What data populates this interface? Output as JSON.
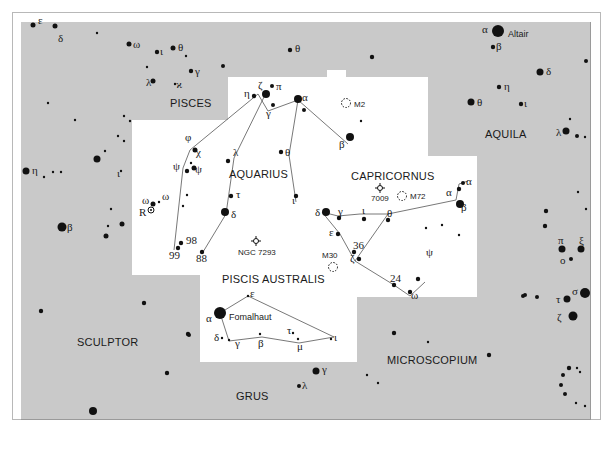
{
  "map": {
    "colors": {
      "background": "#c9c9c9",
      "highlight_region": "#ffffff",
      "stars": "#111111",
      "lines": "#555555"
    },
    "constellations": [
      {
        "name": "PISCES",
        "x": 170,
        "y": 107
      },
      {
        "name": "AQUARIUS",
        "x": 229,
        "y": 178
      },
      {
        "name": "CAPRICORNUS",
        "x": 351,
        "y": 180
      },
      {
        "name": "AQUILA",
        "x": 485,
        "y": 138
      },
      {
        "name": "PISCIS AUSTRALIS",
        "x": 222,
        "y": 283
      },
      {
        "name": "SCULPTOR",
        "x": 77,
        "y": 346
      },
      {
        "name": "MICROSCOPIUM",
        "x": 387,
        "y": 364
      },
      {
        "name": "GRUS",
        "x": 236,
        "y": 400
      }
    ],
    "named_stars": [
      {
        "name": "Altair",
        "x": 508,
        "y": 37
      },
      {
        "name": "Fomalhaut",
        "x": 229,
        "y": 320
      }
    ],
    "deep_sky": [
      {
        "label": "M2",
        "type": "globular-cluster",
        "x": 346,
        "y": 103
      },
      {
        "label": "M72",
        "type": "globular-cluster",
        "x": 402,
        "y": 196
      },
      {
        "label": "7009",
        "type": "planetary-nebula",
        "x": 380,
        "y": 188
      },
      {
        "label": "NGC 7293",
        "type": "planetary-nebula",
        "x": 256,
        "y": 241
      },
      {
        "label": "M30",
        "type": "globular-cluster",
        "x": 333,
        "y": 267
      }
    ],
    "labels": [
      {
        "t": "ε",
        "x": 38,
        "y": 24
      },
      {
        "t": "δ",
        "x": 58,
        "y": 42
      },
      {
        "t": "ω",
        "x": 133,
        "y": 48
      },
      {
        "t": "ι",
        "x": 160,
        "y": 55
      },
      {
        "t": "θ",
        "x": 178,
        "y": 51
      },
      {
        "t": "γ",
        "x": 195,
        "y": 75
      },
      {
        "t": "λ",
        "x": 146,
        "y": 86
      },
      {
        "t": "ϰ",
        "x": 176,
        "y": 88
      },
      {
        "t": "θ",
        "x": 295,
        "y": 52
      },
      {
        "t": "α",
        "x": 482,
        "y": 33
      },
      {
        "t": "β",
        "x": 496,
        "y": 50
      },
      {
        "t": "δ",
        "x": 546,
        "y": 75
      },
      {
        "t": "η",
        "x": 504,
        "y": 90
      },
      {
        "t": "θ",
        "x": 477,
        "y": 106
      },
      {
        "t": "ι",
        "x": 524,
        "y": 107
      },
      {
        "t": "λ",
        "x": 556,
        "y": 136
      },
      {
        "t": "η",
        "x": 244,
        "y": 97
      },
      {
        "t": "ζ",
        "x": 258,
        "y": 89
      },
      {
        "t": "π",
        "x": 276,
        "y": 90
      },
      {
        "t": "γ",
        "x": 266,
        "y": 117
      },
      {
        "t": "α",
        "x": 302,
        "y": 101
      },
      {
        "t": "β",
        "x": 339,
        "y": 148
      },
      {
        "t": "φ",
        "x": 185,
        "y": 141
      },
      {
        "t": "χ",
        "x": 196,
        "y": 156
      },
      {
        "t": "ψ",
        "x": 173,
        "y": 170
      },
      {
        "t": "ψ",
        "x": 195,
        "y": 173
      },
      {
        "t": "λ",
        "x": 233,
        "y": 156
      },
      {
        "t": "θ",
        "x": 285,
        "y": 156
      },
      {
        "t": "τ",
        "x": 236,
        "y": 198
      },
      {
        "t": "δ",
        "x": 231,
        "y": 218
      },
      {
        "t": "ι",
        "x": 292,
        "y": 204
      },
      {
        "t": "ω",
        "x": 142,
        "y": 204
      },
      {
        "t": "ω",
        "x": 162,
        "y": 200
      },
      {
        "t": "R",
        "x": 139,
        "y": 216
      },
      {
        "t": "η",
        "x": 32,
        "y": 174
      },
      {
        "t": "ι",
        "x": 117,
        "y": 177
      },
      {
        "t": "β",
        "x": 67,
        "y": 231
      },
      {
        "t": "δ",
        "x": 315,
        "y": 216
      },
      {
        "t": "γ",
        "x": 338,
        "y": 215
      },
      {
        "t": "ι",
        "x": 362,
        "y": 214
      },
      {
        "t": "θ",
        "x": 387,
        "y": 217
      },
      {
        "t": "α",
        "x": 446,
        "y": 196
      },
      {
        "t": "α",
        "x": 466,
        "y": 185
      },
      {
        "t": "β",
        "x": 461,
        "y": 211
      },
      {
        "t": "ε",
        "x": 329,
        "y": 236
      },
      {
        "t": "ζ",
        "x": 350,
        "y": 262
      },
      {
        "t": "π",
        "x": 558,
        "y": 244
      },
      {
        "t": "ξ",
        "x": 579,
        "y": 244
      },
      {
        "t": "ο",
        "x": 560,
        "y": 264
      },
      {
        "t": "σ",
        "x": 572,
        "y": 295
      },
      {
        "t": "τ",
        "x": 556,
        "y": 303
      },
      {
        "t": "ζ",
        "x": 557,
        "y": 321
      },
      {
        "t": "ψ",
        "x": 426,
        "y": 256
      },
      {
        "t": "ω",
        "x": 411,
        "y": 299
      },
      {
        "t": "α",
        "x": 206,
        "y": 322
      },
      {
        "t": "ε",
        "x": 250,
        "y": 297
      },
      {
        "t": "δ",
        "x": 214,
        "y": 341
      },
      {
        "t": "γ",
        "x": 235,
        "y": 347
      },
      {
        "t": "β",
        "x": 258,
        "y": 347
      },
      {
        "t": "τ",
        "x": 287,
        "y": 334
      },
      {
        "t": "μ",
        "x": 297,
        "y": 350
      },
      {
        "t": "ι",
        "x": 334,
        "y": 341
      },
      {
        "t": "γ",
        "x": 322,
        "y": 373
      },
      {
        "t": "λ",
        "x": 302,
        "y": 389
      }
    ],
    "numbers": [
      {
        "t": "98",
        "x": 186,
        "y": 244
      },
      {
        "t": "99",
        "x": 169,
        "y": 259
      },
      {
        "t": "88",
        "x": 196,
        "y": 262
      },
      {
        "t": "36",
        "x": 353,
        "y": 249
      },
      {
        "t": "24",
        "x": 390,
        "y": 282
      }
    ]
  }
}
